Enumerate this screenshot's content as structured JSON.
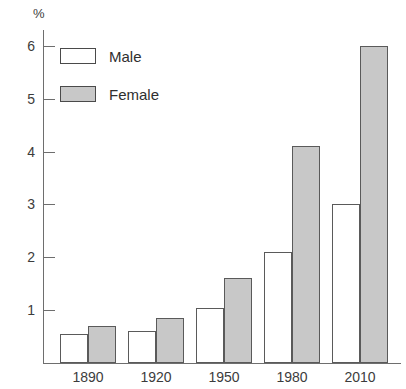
{
  "chart_data": {
    "type": "bar",
    "title": "",
    "subtitle": "",
    "xlabel": "",
    "ylabel": "%",
    "unit_label": "%",
    "categories": [
      "1890",
      "1920",
      "1950",
      "1980",
      "2010"
    ],
    "series": [
      {
        "name": "Male",
        "color": "#ffffff",
        "values": [
          0.55,
          0.6,
          1.05,
          2.1,
          3.0
        ]
      },
      {
        "name": "Female",
        "color": "#c8c8c8",
        "values": [
          0.7,
          0.85,
          1.6,
          4.1,
          6.0
        ]
      }
    ],
    "ylim": [
      0,
      6.3
    ],
    "yticks": [
      1,
      2,
      3,
      4,
      5,
      6
    ],
    "ytick_labels": [
      "1",
      "2",
      "3",
      "4",
      "5",
      "6"
    ],
    "grid": false,
    "legend_position": "top-left",
    "legend": [
      {
        "label": "Male",
        "color": "#ffffff"
      },
      {
        "label": "Female",
        "color": "#c8c8c8"
      }
    ]
  },
  "style": {
    "axis_color": "#6e6e6e",
    "bar_border_color": "#5a5a5a",
    "text_color": "#3c3c3c",
    "background": "#ffffff"
  }
}
